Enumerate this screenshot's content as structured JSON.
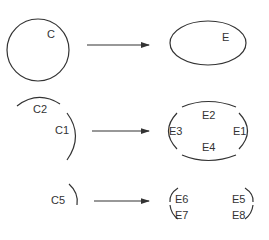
{
  "diagram": {
    "rows": [
      {
        "source": {
          "shape": "circle",
          "labels": [
            "C"
          ]
        },
        "target": {
          "shape": "ellipse",
          "labels": [
            "E"
          ]
        }
      },
      {
        "source": {
          "shape": "arcs",
          "labels": [
            "C2",
            "C1"
          ]
        },
        "target": {
          "shape": "ellipse-segments",
          "labels": [
            "E2",
            "E3",
            "E1",
            "E4"
          ]
        }
      },
      {
        "source": {
          "shape": "arc",
          "labels": [
            "C5"
          ]
        },
        "target": {
          "shape": "arc-segments",
          "labels": [
            "E6",
            "E5",
            "E7",
            "E8"
          ]
        }
      }
    ],
    "colors": {
      "stroke": "#333333",
      "background": "#ffffff"
    }
  }
}
